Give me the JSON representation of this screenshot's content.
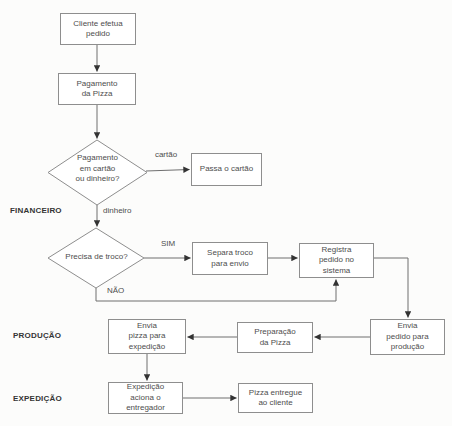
{
  "lanes": {
    "financeiro": "FINANCEIRO",
    "producao": "PRODUÇÃO",
    "expedicao": "EXPEDIÇÃO"
  },
  "nodes": {
    "cliente_efetua_pedido": "Cliente efetua\npedido",
    "pagamento_da_pizza": "Pagamento\nda Pizza",
    "decisao_pagamento": "Pagamento\nem cartão\nou dinheiro?",
    "passa_o_cartao": "Passa o cartão",
    "decisao_troco": "Precisa de troco?",
    "separa_troco": "Separa troco\npara envio",
    "registra_pedido": "Registra\npedido no\nsistema",
    "envia_pedido_producao": "Envia\npedido para\nprodução",
    "preparacao_da_pizza": "Preparação\nda Pizza",
    "envia_pizza_expedicao": "Envia\npizza para\nexpedição",
    "expedicao_aciona_entregador": "Expedição\naciona o\nentregador",
    "pizza_entregue_cliente": "Pizza entregue\nao cliente"
  },
  "edge_labels": {
    "cartao": "cartão",
    "dinheiro": "dinheiro",
    "sim": "SIM",
    "nao": "NÃO"
  },
  "colors": {
    "box_border": "#8e8e8e",
    "connector": "#6f6f6f",
    "arrowhead": "#333333",
    "text": "#4d4d4d",
    "lane_label": "#343434",
    "background": "#fcfcfb"
  }
}
